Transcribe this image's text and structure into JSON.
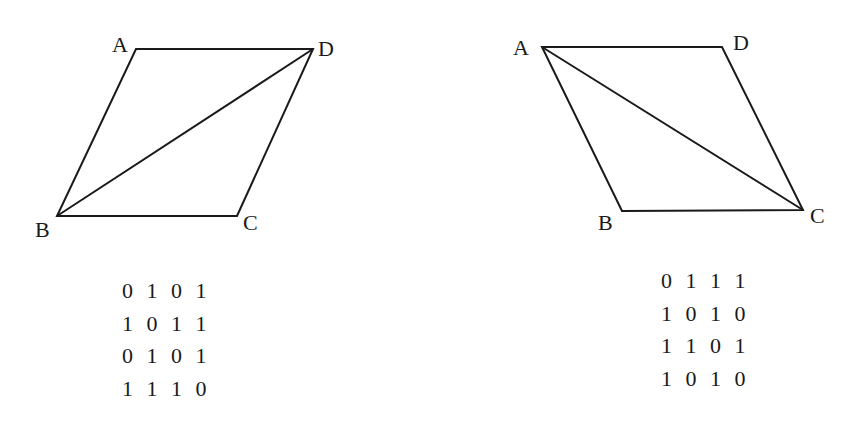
{
  "figures": [
    {
      "id": "left",
      "shape": "parallelogram",
      "diagonal": "BD",
      "vertices": {
        "A": {
          "x": 136,
          "y": 49
        },
        "D": {
          "x": 313,
          "y": 49
        },
        "C": {
          "x": 237,
          "y": 216
        },
        "B": {
          "x": 57,
          "y": 216
        }
      },
      "labels": {
        "A": "A",
        "B": "B",
        "C": "C",
        "D": "D"
      },
      "matrix": [
        [
          0,
          1,
          0,
          1
        ],
        [
          1,
          0,
          1,
          1
        ],
        [
          0,
          1,
          0,
          1
        ],
        [
          1,
          1,
          1,
          0
        ]
      ]
    },
    {
      "id": "right",
      "shape": "parallelogram",
      "diagonal": "AC",
      "vertices": {
        "A": {
          "x": 542,
          "y": 47
        },
        "D": {
          "x": 722,
          "y": 47
        },
        "C": {
          "x": 803,
          "y": 210
        },
        "B": {
          "x": 622,
          "y": 211
        }
      },
      "labels": {
        "A": "A",
        "B": "B",
        "C": "C",
        "D": "D"
      },
      "matrix": [
        [
          0,
          1,
          1,
          1
        ],
        [
          1,
          0,
          1,
          0
        ],
        [
          1,
          1,
          0,
          1
        ],
        [
          1,
          0,
          1,
          0
        ]
      ]
    }
  ],
  "colors": {
    "stroke": "#1a1a1a",
    "background": "#ffffff"
  }
}
